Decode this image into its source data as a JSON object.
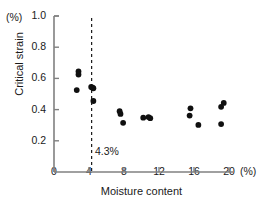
{
  "chart_data": {
    "type": "scatter",
    "title": "",
    "xlabel": "Moisture content",
    "ylabel": "Critical strain",
    "x_unit": "(%)",
    "y_unit": "(%)",
    "xlim": [
      0,
      20
    ],
    "ylim": [
      0,
      1.0
    ],
    "xticks": [
      0,
      4,
      8,
      12,
      16,
      20
    ],
    "xtick_labels": [
      "0",
      "4",
      "8",
      "12",
      "16",
      "20"
    ],
    "yticks": [
      0.2,
      0.4,
      0.6,
      0.8,
      1.0
    ],
    "ytick_labels": [
      "0.2",
      "0.4",
      "0.6",
      "0.8",
      "1.0"
    ],
    "grid": false,
    "legend": null,
    "marker": "filled-circle",
    "marker_color": "#101010",
    "points": [
      {
        "x": 2.8,
        "y": 0.645
      },
      {
        "x": 2.8,
        "y": 0.625
      },
      {
        "x": 2.6,
        "y": 0.525
      },
      {
        "x": 4.25,
        "y": 0.545
      },
      {
        "x": 4.4,
        "y": 0.54
      },
      {
        "x": 4.5,
        "y": 0.537
      },
      {
        "x": 4.5,
        "y": 0.455
      },
      {
        "x": 7.5,
        "y": 0.39
      },
      {
        "x": 7.6,
        "y": 0.372
      },
      {
        "x": 7.9,
        "y": 0.315
      },
      {
        "x": 10.2,
        "y": 0.348
      },
      {
        "x": 10.8,
        "y": 0.352
      },
      {
        "x": 11.0,
        "y": 0.345
      },
      {
        "x": 15.6,
        "y": 0.408
      },
      {
        "x": 15.5,
        "y": 0.362
      },
      {
        "x": 16.5,
        "y": 0.302
      },
      {
        "x": 19.4,
        "y": 0.443
      },
      {
        "x": 19.1,
        "y": 0.418
      },
      {
        "x": 19.1,
        "y": 0.307
      }
    ],
    "annotations": [
      {
        "text": "4.3%",
        "x": 4.3,
        "y": 0.11,
        "type": "threshold-label"
      }
    ],
    "reference_lines": [
      {
        "orientation": "vertical",
        "x": 4.3,
        "style": "dashed",
        "color": "#1a1a1a",
        "label": "4.3%"
      }
    ]
  },
  "axes": {
    "axis_color": "#808080",
    "tick_color": "#808080"
  }
}
